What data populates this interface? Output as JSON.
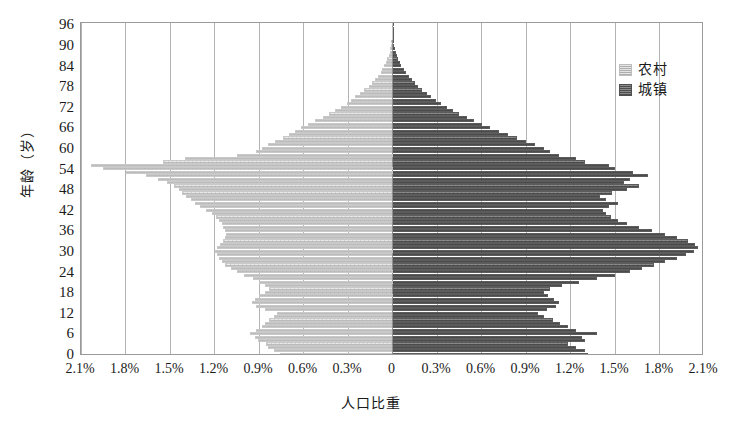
{
  "chart_data": {
    "type": "bar",
    "subtype": "population-pyramid",
    "title": "",
    "xlabel": "人口比重",
    "ylabel": "年龄（岁）",
    "orientation": "horizontal-diverging",
    "grid": true,
    "legend_position": "top-right",
    "xlim": [
      -2.1,
      2.1
    ],
    "ylim": [
      0,
      97
    ],
    "x_tick_labels": [
      "2.1%",
      "1.8%",
      "1.5%",
      "1.2%",
      "0.9%",
      "0.6%",
      "0.3%",
      "0",
      "0.3%",
      "0.6%",
      "0.9%",
      "1.2%",
      "1.5%",
      "1.8%",
      "2.1%"
    ],
    "x_tick_values": [
      -2.1,
      -1.8,
      -1.5,
      -1.2,
      -0.9,
      -0.6,
      -0.3,
      0,
      0.3,
      0.6,
      0.9,
      1.2,
      1.5,
      1.8,
      2.1
    ],
    "y_tick_labels": [
      "0",
      "6",
      "12",
      "18",
      "24",
      "30",
      "36",
      "42",
      "48",
      "54",
      "60",
      "66",
      "72",
      "78",
      "84",
      "90",
      "96"
    ],
    "y_tick_values": [
      0,
      6,
      12,
      18,
      24,
      30,
      36,
      42,
      48,
      54,
      60,
      66,
      72,
      78,
      84,
      90,
      96
    ],
    "ages": [
      0,
      1,
      2,
      3,
      4,
      5,
      6,
      7,
      8,
      9,
      10,
      11,
      12,
      13,
      14,
      15,
      16,
      17,
      18,
      19,
      20,
      21,
      22,
      23,
      24,
      25,
      26,
      27,
      28,
      29,
      30,
      31,
      32,
      33,
      34,
      35,
      36,
      37,
      38,
      39,
      40,
      41,
      42,
      43,
      44,
      45,
      46,
      47,
      48,
      49,
      50,
      51,
      52,
      53,
      54,
      55,
      56,
      57,
      58,
      59,
      60,
      61,
      62,
      63,
      64,
      65,
      66,
      67,
      68,
      69,
      70,
      71,
      72,
      73,
      74,
      75,
      76,
      77,
      78,
      79,
      80,
      81,
      82,
      83,
      84,
      85,
      86,
      87,
      88,
      89,
      90,
      91,
      92,
      93,
      94,
      95,
      96
    ],
    "series": [
      {
        "name": "农村",
        "color": "#e9e9e9",
        "side": "left",
        "unit": "%",
        "values": [
          0.76,
          0.8,
          0.84,
          0.85,
          0.91,
          0.93,
          0.96,
          0.92,
          0.88,
          0.86,
          0.83,
          0.8,
          0.78,
          0.86,
          0.92,
          0.95,
          0.93,
          0.9,
          0.86,
          0.83,
          0.86,
          0.9,
          0.94,
          1.0,
          1.05,
          1.09,
          1.13,
          1.15,
          1.17,
          1.18,
          1.2,
          1.18,
          1.16,
          1.14,
          1.13,
          1.12,
          1.13,
          1.14,
          1.15,
          1.17,
          1.19,
          1.22,
          1.26,
          1.3,
          1.33,
          1.36,
          1.39,
          1.42,
          1.44,
          1.47,
          1.52,
          1.58,
          1.66,
          1.8,
          1.95,
          2.03,
          1.55,
          1.4,
          1.05,
          0.92,
          0.88,
          0.84,
          0.79,
          0.74,
          0.7,
          0.66,
          0.62,
          0.57,
          0.52,
          0.47,
          0.43,
          0.39,
          0.35,
          0.31,
          0.28,
          0.25,
          0.22,
          0.19,
          0.16,
          0.14,
          0.12,
          0.1,
          0.08,
          0.07,
          0.055,
          0.045,
          0.035,
          0.026,
          0.019,
          0.014,
          0.01,
          0.007,
          0.005,
          0.003,
          0.002,
          0.0015,
          0.001
        ]
      },
      {
        "name": "城镇",
        "color": "#8b8b8b",
        "side": "right",
        "unit": "%",
        "values": [
          1.32,
          1.3,
          1.24,
          1.18,
          1.3,
          1.28,
          1.38,
          1.24,
          1.18,
          1.13,
          1.08,
          1.02,
          0.98,
          1.04,
          1.1,
          1.12,
          1.09,
          1.05,
          1.02,
          1.06,
          1.14,
          1.26,
          1.38,
          1.5,
          1.6,
          1.68,
          1.76,
          1.84,
          1.92,
          1.98,
          2.03,
          2.06,
          2.04,
          1.99,
          1.92,
          1.84,
          1.75,
          1.66,
          1.58,
          1.52,
          1.47,
          1.44,
          1.42,
          1.46,
          1.52,
          1.44,
          1.4,
          1.48,
          1.58,
          1.66,
          1.56,
          1.6,
          1.72,
          1.62,
          1.5,
          1.46,
          1.3,
          1.24,
          1.12,
          1.06,
          1.02,
          0.96,
          0.9,
          0.84,
          0.78,
          0.72,
          0.66,
          0.6,
          0.55,
          0.5,
          0.45,
          0.41,
          0.37,
          0.33,
          0.29,
          0.26,
          0.23,
          0.2,
          0.17,
          0.15,
          0.13,
          0.11,
          0.09,
          0.075,
          0.06,
          0.048,
          0.038,
          0.029,
          0.021,
          0.015,
          0.011,
          0.008,
          0.005,
          0.0035,
          0.0022,
          0.0015,
          0.001
        ]
      }
    ]
  },
  "legend": {
    "items": [
      {
        "label": "农村"
      },
      {
        "label": "城镇"
      }
    ]
  }
}
